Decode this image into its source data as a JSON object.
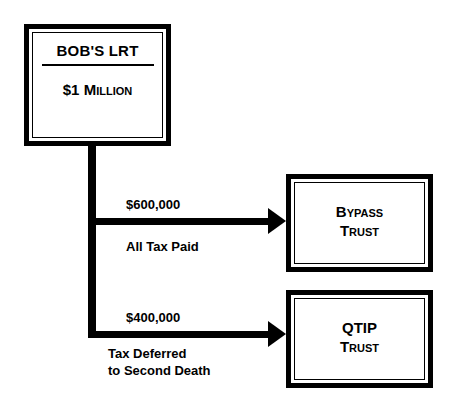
{
  "diagram": {
    "background_color": "#ffffff",
    "line_color": "#000000"
  },
  "nodes": {
    "source": {
      "title": "BOB'S LRT",
      "amount": "$1 M",
      "amount_rest": "illion",
      "amount_full": "$1 MILLION"
    },
    "bypass": {
      "line1": "B",
      "line1_rest": "ypass",
      "line1_full": "BYPASS",
      "line2": "T",
      "line2_rest": "rust",
      "line2_full": "TRUST"
    },
    "qtip": {
      "line1_full": "QTIP",
      "line2": "T",
      "line2_rest": "rust",
      "line2_full": "TRUST"
    }
  },
  "edges": [
    {
      "amount": "$600,000",
      "note": "All Tax Paid",
      "target": "Bypass Trust"
    },
    {
      "amount": "$400,000",
      "note_line1": "Tax Deferred",
      "note_line2": "to Second Death",
      "target": "QTIP Trust"
    }
  ]
}
